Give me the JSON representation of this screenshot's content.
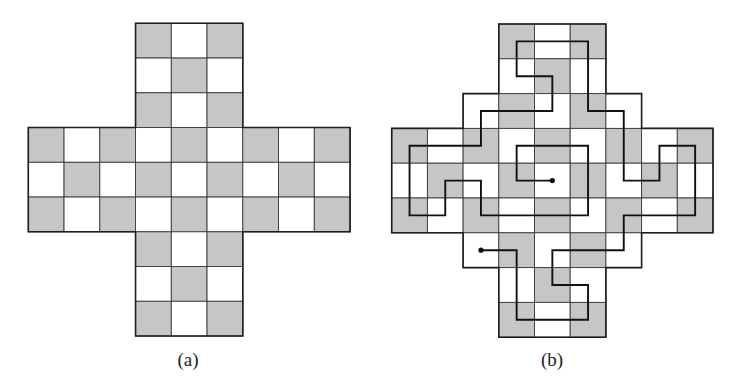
{
  "colors": {
    "background": "#ffffff",
    "shaded_cell": "#c6c6c6",
    "light_cell": "#ffffff",
    "grid_line": "#3a3a3a",
    "outline": "#1e1e1e",
    "path": "#111111"
  },
  "shading_rule": "cell (row, col) is shaded when row + col is odd",
  "figures": [
    {
      "id": "a",
      "caption": "(a)",
      "caption_pos": [
        188,
        359
      ],
      "origin": [
        28.3,
        23.3
      ],
      "cell_w": 35.75,
      "cell_h": 34.75,
      "grid_size": 9,
      "row_spans": [
        [
          3,
          5
        ],
        [
          3,
          5
        ],
        [
          3,
          5
        ],
        [
          0,
          8
        ],
        [
          0,
          8
        ],
        [
          0,
          8
        ],
        [
          3,
          5
        ],
        [
          3,
          5
        ],
        [
          3,
          5
        ]
      ],
      "path": [],
      "path_endpoints": []
    },
    {
      "id": "b",
      "caption": "(b)",
      "caption_pos": [
        552,
        359
      ],
      "origin": [
        391.7,
        24
      ],
      "cell_w": 35.7,
      "cell_h": 34.8,
      "grid_size": 9,
      "row_spans": [
        [
          3,
          5
        ],
        [
          3,
          5
        ],
        [
          2,
          6
        ],
        [
          0,
          8
        ],
        [
          0,
          8
        ],
        [
          0,
          8
        ],
        [
          2,
          6
        ],
        [
          3,
          5
        ],
        [
          3,
          5
        ]
      ],
      "path": [
        [
          2,
          6
        ],
        [
          3,
          6
        ],
        [
          3,
          8
        ],
        [
          5,
          8
        ],
        [
          5,
          7
        ],
        [
          4,
          7
        ],
        [
          4,
          6
        ],
        [
          6,
          6
        ],
        [
          6,
          5
        ],
        [
          8,
          5
        ],
        [
          8,
          3
        ],
        [
          7,
          3
        ],
        [
          7,
          4
        ],
        [
          6,
          4
        ],
        [
          6,
          2
        ],
        [
          5,
          2
        ],
        [
          5,
          0
        ],
        [
          3,
          0
        ],
        [
          3,
          1
        ],
        [
          4,
          1
        ],
        [
          4,
          2
        ],
        [
          2,
          2
        ],
        [
          2,
          3
        ],
        [
          0,
          3
        ],
        [
          0,
          5
        ],
        [
          1,
          5
        ],
        [
          1,
          4
        ],
        [
          2,
          4
        ],
        [
          2,
          5
        ],
        [
          5,
          5
        ],
        [
          5,
          3
        ],
        [
          3,
          3
        ],
        [
          3,
          4
        ],
        [
          4,
          4
        ]
      ],
      "path_endpoints": [
        [
          2,
          6
        ],
        [
          4,
          4
        ]
      ]
    }
  ]
}
